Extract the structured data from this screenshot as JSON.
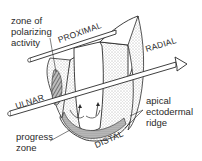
{
  "diagram": {
    "axes": {
      "proximal": "PROXIMAL",
      "distal": "DISTAL",
      "radial": "RADIAL",
      "ulnar": "ULNAR"
    },
    "regions": {
      "zpa_line1": "zone of",
      "zpa_line2": "polarizing",
      "zpa_line3": "activity",
      "progress_line1": "progress",
      "progress_line2": "zone",
      "aer_line1": "apical",
      "aer_line2": "ectodermal",
      "aer_line3": "ridge"
    },
    "colors": {
      "ink": "#2a2a2a",
      "background": "#ffffff"
    }
  }
}
